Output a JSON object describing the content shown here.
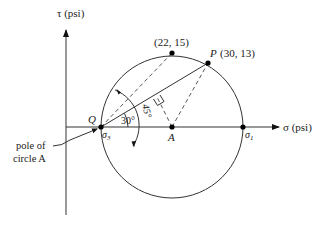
{
  "diagram": {
    "axes": {
      "tau_label": "τ (psi)",
      "sigma_label": "σ (psi)"
    },
    "points": {
      "top": {
        "label": "(22, 15)",
        "sigma": 22,
        "tau": 15
      },
      "P": {
        "name": "P",
        "coords": "(30, 13)",
        "sigma": 30,
        "tau": 13
      },
      "Q": {
        "name": "Q"
      },
      "A": {
        "name": "A"
      },
      "sigma3": {
        "base": "σ",
        "sub": "3"
      },
      "sigma1": {
        "base": "σ",
        "sub": "1"
      }
    },
    "angles": {
      "a30": "30°",
      "a45": "45°"
    },
    "callout": {
      "line1": "pole of",
      "line2": "circle A"
    }
  }
}
